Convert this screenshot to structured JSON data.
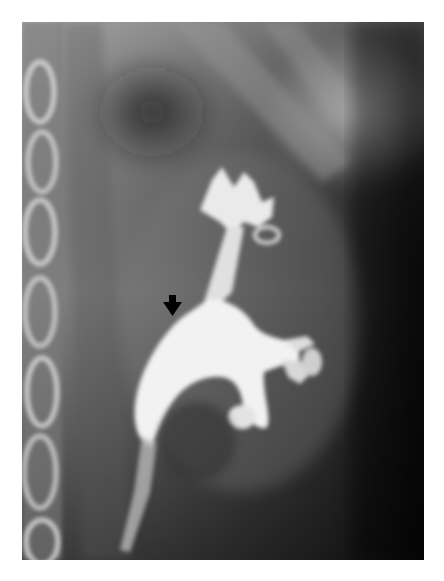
{
  "figure": {
    "kind": "radiograph",
    "annotation": {
      "type": "arrow",
      "direction": "down",
      "icon": "arrow-down-icon",
      "color": "#000000"
    },
    "colors": {
      "page_background": "#ffffff",
      "frame_dark": "#050505",
      "contrast_bright": "#f4f4f4"
    }
  }
}
